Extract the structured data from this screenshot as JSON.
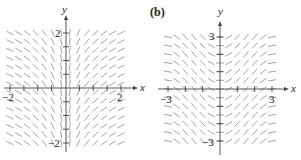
{
  "chart_data": [
    {
      "type": "slope_field",
      "panel_label": "(a)",
      "xlabel": "x",
      "ylabel": "y",
      "xlim": [
        -2,
        2
      ],
      "ylim": [
        -2,
        2
      ],
      "x_tick_labels": [
        "-2",
        "2"
      ],
      "y_tick_labels": [
        "2",
        "-2"
      ],
      "tick_step": 0.5,
      "grid": false,
      "description": "Slope depends on x only; steep near x=0, nearly horizontal for large |x|; negative slopes for x<0, positive for x>0",
      "slope_rule": "1/x",
      "samples_per_axis": 13
    },
    {
      "type": "slope_field",
      "panel_label": "(b)",
      "xlabel": "x",
      "ylabel": "y",
      "xlim": [
        -3,
        3
      ],
      "ylim": [
        -3,
        3
      ],
      "x_tick_labels": [
        "-3",
        "3"
      ],
      "y_tick_labels": [
        "3",
        "-3"
      ],
      "tick_step": 1,
      "grid": false,
      "description": "Slope depends on x only, oscillating periodically (positive, zero, negative) across x",
      "slope_rule": "sin(x)",
      "samples_per_axis": 12
    }
  ],
  "panels": {
    "a": {
      "label": "",
      "x_axis_label": "x",
      "y_axis_label": "y",
      "tick_x_min": "−2",
      "tick_x_max": "2",
      "tick_y_max": "2",
      "tick_y_min": "−2"
    },
    "b": {
      "label": "(b)",
      "x_axis_label": "x",
      "y_axis_label": "y",
      "tick_x_min": "−3",
      "tick_x_max": "3",
      "tick_y_max": "3",
      "tick_y_min": "−3"
    }
  }
}
